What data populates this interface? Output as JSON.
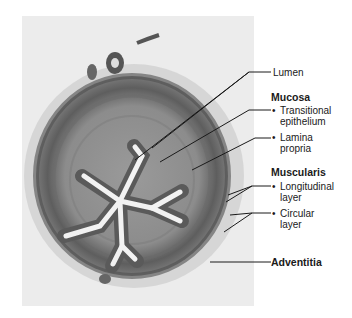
{
  "figure": {
    "labels": {
      "lumen": "Lumen",
      "mucosa": {
        "heading": "Mucosa",
        "items": [
          "Transitional epithelium",
          "Lamina propria"
        ],
        "item_lines": [
          [
            "Transitional",
            "epithelium"
          ],
          [
            "Lamina",
            "propria"
          ]
        ]
      },
      "muscularis": {
        "heading": "Muscularis",
        "items": [
          "Longitudinal layer",
          "Circular layer"
        ],
        "item_lines": [
          [
            "Longitudinal",
            "layer"
          ],
          [
            "Circular",
            "layer"
          ]
        ]
      },
      "adventitia": "Adventitia"
    }
  },
  "colors": {
    "panel_bg": "#ececec",
    "tissue_dark": "#5a5a5a",
    "tissue_mid": "#8a8a8a",
    "lumen": "#f2f2f2",
    "leader_line": "#1a1a1a"
  }
}
